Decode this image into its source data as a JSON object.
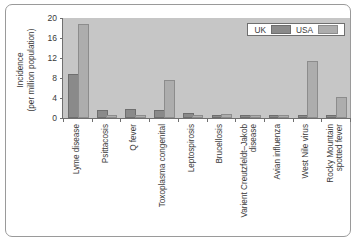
{
  "chart_data": {
    "type": "bar",
    "title": "",
    "xlabel": "",
    "ylabel": "Incidence (per million population)",
    "ylabel_lines": [
      "Incidence",
      "(per million population)"
    ],
    "ylim": [
      0,
      20
    ],
    "yticks": [
      0,
      4,
      8,
      12,
      16,
      20
    ],
    "grid": false,
    "legend_position": "top-right",
    "categories": [
      "Lyme disease",
      "Psittacosis",
      "Q fever",
      "Toxoplasma congenital",
      "Leptospirosis",
      "Brucellosis",
      "Varient Creutzfeldt–Jakob disease",
      "Avian influenza",
      "West Nile virus",
      "Rocky Mountain spotted fever"
    ],
    "category_lines": [
      [
        "Lyme disease"
      ],
      [
        "Psittacosis"
      ],
      [
        "Q fever"
      ],
      [
        "Toxoplasma congenital"
      ],
      [
        "Leptospirosis"
      ],
      [
        "Brucellosis"
      ],
      [
        "Varient Creutzfeldt–Jakob",
        "disease"
      ],
      [
        "Avian influenza"
      ],
      [
        "West Nile virus"
      ],
      [
        "Rocky Mountain",
        "spotted fever"
      ]
    ],
    "series": [
      {
        "name": "UK",
        "color": "#8a8a8a",
        "values": [
          8.4,
          1.3,
          1.4,
          1.3,
          0.6,
          0.25,
          0.12,
          0.12,
          0.05,
          0.05
        ]
      },
      {
        "name": "USA",
        "color": "#adadad",
        "values": [
          18.4,
          0.15,
          0.3,
          7.3,
          0.25,
          0.5,
          0.08,
          0.1,
          11.0,
          3.8
        ]
      }
    ]
  },
  "legend": {
    "items": [
      {
        "label": "UK",
        "swatch": "uk"
      },
      {
        "label": "USA",
        "swatch": "usa"
      }
    ]
  },
  "colors": {
    "uk": "#8a8a8a",
    "usa": "#adadad",
    "plot_background": "#c6c6c6",
    "axis": "#6f6f6f",
    "frame_border": "#9a9a9a",
    "page_background": "#ffffff"
  }
}
